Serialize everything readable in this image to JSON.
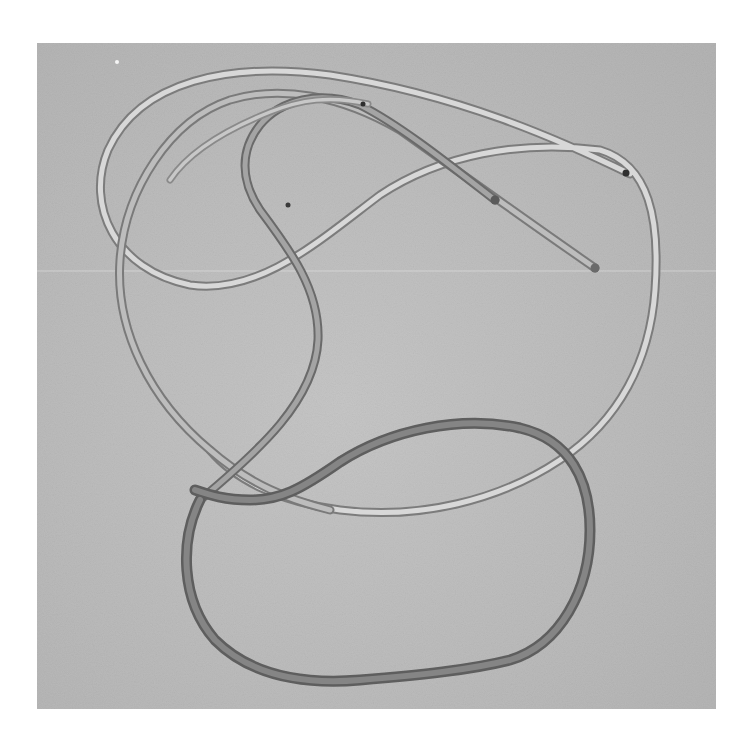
{
  "image": {
    "description": "Grayscale photograph of a long flexible tube / cable loosely tangled into overlapping loops on a textured gray surface",
    "background_color": "#bdbdbd",
    "margin_color": "#ffffff",
    "tube_colors": {
      "light_section": "#e6e6e6",
      "mid_section": "#9a9a9a",
      "dark_section": "#6e6e6e"
    },
    "subjects": [
      {
        "name": "tube-loop-upper",
        "tone": "light"
      },
      {
        "name": "tube-loop-middle",
        "tone": "mid"
      },
      {
        "name": "tube-loop-lower",
        "tone": "dark"
      },
      {
        "name": "tube-end-1",
        "tone": "mid"
      },
      {
        "name": "tube-end-2",
        "tone": "light"
      },
      {
        "name": "tube-end-3",
        "tone": "mid"
      }
    ]
  }
}
